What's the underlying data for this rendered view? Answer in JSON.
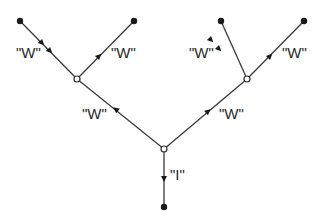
{
  "diagram": {
    "title": "",
    "colors": {
      "line": "#3a3a3a",
      "node_fill": "#1a1a1a",
      "vertex_fill": "#ffffff",
      "text": "#2a2a2a"
    },
    "nodes": [
      {
        "id": "leaf-1",
        "type": "external",
        "x": 20,
        "y": 21
      },
      {
        "id": "leaf-2",
        "type": "external",
        "x": 134,
        "y": 21
      },
      {
        "id": "leaf-3",
        "type": "external",
        "x": 221,
        "y": 21
      },
      {
        "id": "leaf-4",
        "type": "external",
        "x": 304,
        "y": 21
      },
      {
        "id": "vertex-left",
        "type": "vertex",
        "x": 77,
        "y": 79
      },
      {
        "id": "vertex-right",
        "type": "vertex",
        "x": 247,
        "y": 79
      },
      {
        "id": "vertex-center",
        "type": "vertex",
        "x": 164,
        "y": 149
      },
      {
        "id": "leaf-bottom",
        "type": "external",
        "x": 164,
        "y": 207
      }
    ],
    "edges": [
      {
        "from": "leaf-1",
        "to": "vertex-left",
        "label": "\"W\"",
        "arrows": "double"
      },
      {
        "from": "vertex-left",
        "to": "leaf-2",
        "label": "\"W\"",
        "arrows": "single"
      },
      {
        "from": "leaf-3",
        "to": "vertex-right",
        "label": "\"W\"",
        "arrows": "double"
      },
      {
        "from": "vertex-right",
        "to": "leaf-4",
        "label": "\"W\"",
        "arrows": "single"
      },
      {
        "from": "vertex-center",
        "to": "vertex-left",
        "label": "\"W\"",
        "arrows": "single"
      },
      {
        "from": "vertex-center",
        "to": "vertex-right",
        "label": "\"W\"",
        "arrows": "single"
      },
      {
        "from": "vertex-center",
        "to": "leaf-bottom",
        "label": "\"I\"",
        "arrows": "single"
      }
    ],
    "labels": {
      "w1": "\"W\"",
      "w2": "\"W\"",
      "w3": "\"W\"",
      "w4": "\"W\"",
      "w5": "\"W\"",
      "w6": "\"W\"",
      "i1": "\"I\""
    }
  }
}
